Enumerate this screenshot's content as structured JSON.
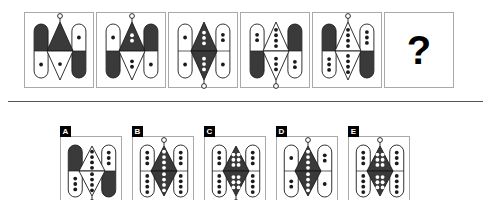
{
  "puzzle": {
    "type": "visual-analogy-matrix",
    "question_mark": "?",
    "divider": true,
    "colors": {
      "ink": "#1a1a1a",
      "dark_fill": "#3a3a3a",
      "light_fill": "#ffffff",
      "stroke": "#1a1a1a",
      "panel_border": "#aaaaaa",
      "letter_badge_bg": "#000000",
      "letter_badge_text": "#ffffff"
    },
    "geometry": {
      "panel_width_seq": 70,
      "panel_height_seq": 76,
      "panel_width_opt": 62,
      "panel_height_opt": 68,
      "capsule_width": 14,
      "capsule_height": 54,
      "diamond_width": 26,
      "diamond_height": 58
    },
    "sequence": [
      {
        "index": 1,
        "name": "sequence-panel-1",
        "left_capsule": {
          "top_fill": "dark",
          "bottom_fill": "light",
          "top_dots": 0,
          "bottom_dots": 1,
          "dot_color": "dark",
          "knob": "none"
        },
        "center_diamond": {
          "top_fill": "dark",
          "bottom_fill": "light",
          "top_dots": 0,
          "bottom_dots": 1,
          "dot_color": "dark",
          "knob": "top"
        },
        "right_capsule": {
          "top_fill": "light",
          "bottom_fill": "dark",
          "top_dots": 1,
          "bottom_dots": 0,
          "dot_color": "dark",
          "knob": "none"
        }
      },
      {
        "index": 2,
        "name": "sequence-panel-2",
        "left_capsule": {
          "top_fill": "light",
          "bottom_fill": "dark",
          "top_dots": 1,
          "bottom_dots": 0,
          "dot_color": "dark",
          "knob": "none"
        },
        "center_diamond": {
          "top_fill": "dark",
          "bottom_fill": "light",
          "top_dots": 2,
          "bottom_dots": 2,
          "dot_color": "mixed",
          "knob": "top"
        },
        "right_capsule": {
          "top_fill": "dark",
          "bottom_fill": "light",
          "top_dots": 0,
          "bottom_dots": 1,
          "dot_color": "dark",
          "knob": "none"
        }
      },
      {
        "index": 3,
        "name": "sequence-panel-3",
        "left_capsule": {
          "top_fill": "light",
          "bottom_fill": "light",
          "top_dots": 1,
          "bottom_dots": 1,
          "dot_color": "dark",
          "knob": "none"
        },
        "center_diamond": {
          "top_fill": "dark",
          "bottom_fill": "dark",
          "top_dots": 3,
          "bottom_dots": 3,
          "dot_color": "light",
          "knob": "bottom"
        },
        "right_capsule": {
          "top_fill": "light",
          "bottom_fill": "light",
          "top_dots": 2,
          "bottom_dots": 1,
          "dot_color": "dark",
          "knob": "none"
        }
      },
      {
        "index": 4,
        "name": "sequence-panel-4",
        "left_capsule": {
          "top_fill": "light",
          "bottom_fill": "dark",
          "top_dots": 2,
          "bottom_dots": 0,
          "dot_color": "dark",
          "knob": "none"
        },
        "center_diamond": {
          "top_fill": "light",
          "bottom_fill": "light",
          "top_dots": 4,
          "bottom_dots": 3,
          "dot_color": "dark",
          "knob": "bottom"
        },
        "right_capsule": {
          "top_fill": "dark",
          "bottom_fill": "light",
          "top_dots": 0,
          "bottom_dots": 2,
          "dot_color": "dark",
          "knob": "none"
        }
      },
      {
        "index": 5,
        "name": "sequence-panel-5",
        "left_capsule": {
          "top_fill": "dark",
          "bottom_fill": "light",
          "top_dots": 0,
          "bottom_dots": 3,
          "dot_color": "dark",
          "knob": "none"
        },
        "center_diamond": {
          "top_fill": "light",
          "bottom_fill": "light",
          "top_dots": 4,
          "bottom_dots": 4,
          "dot_color": "dark",
          "knob": "top"
        },
        "right_capsule": {
          "top_fill": "light",
          "bottom_fill": "dark",
          "top_dots": 3,
          "bottom_dots": 0,
          "dot_color": "dark",
          "knob": "none"
        }
      },
      {
        "index": 6,
        "name": "sequence-panel-question",
        "is_question": true
      }
    ],
    "options": [
      {
        "letter": "A",
        "name": "option-a",
        "left_capsule": {
          "top_fill": "dark",
          "bottom_fill": "light",
          "top_dots": 0,
          "bottom_dots": 3,
          "dot_color": "dark",
          "knob": "none"
        },
        "center_diamond": {
          "top_fill": "light",
          "bottom_fill": "light",
          "top_dots": 4,
          "bottom_dots": 4,
          "dot_color": "dark",
          "knob": "bottom"
        },
        "right_capsule": {
          "top_fill": "light",
          "bottom_fill": "dark",
          "top_dots": 3,
          "bottom_dots": 0,
          "dot_color": "dark",
          "knob": "none"
        }
      },
      {
        "letter": "B",
        "name": "option-b",
        "left_capsule": {
          "top_fill": "light",
          "bottom_fill": "light",
          "top_dots": 3,
          "bottom_dots": 4,
          "dot_color": "dark",
          "knob": "none"
        },
        "center_diamond": {
          "top_fill": "dark",
          "bottom_fill": "dark",
          "top_dots": 4,
          "bottom_dots": 4,
          "dot_color": "light",
          "knob": "top"
        },
        "right_capsule": {
          "top_fill": "light",
          "bottom_fill": "light",
          "top_dots": 3,
          "bottom_dots": 4,
          "dot_color": "dark",
          "knob": "none"
        }
      },
      {
        "letter": "C",
        "name": "option-c",
        "left_capsule": {
          "top_fill": "light",
          "bottom_fill": "light",
          "top_dots": 3,
          "bottom_dots": 4,
          "dot_color": "dark",
          "knob": "none"
        },
        "center_diamond": {
          "top_fill": "dark",
          "bottom_fill": "dark",
          "top_dots": 6,
          "bottom_dots": 6,
          "dot_color": "light",
          "knob": "bottom"
        },
        "right_capsule": {
          "top_fill": "light",
          "bottom_fill": "light",
          "top_dots": 3,
          "bottom_dots": 4,
          "dot_color": "dark",
          "knob": "none"
        }
      },
      {
        "letter": "D",
        "name": "option-d",
        "left_capsule": {
          "top_fill": "light",
          "bottom_fill": "light",
          "top_dots": 1,
          "bottom_dots": 2,
          "dot_color": "dark",
          "knob": "none"
        },
        "center_diamond": {
          "top_fill": "dark",
          "bottom_fill": "dark",
          "top_dots": 4,
          "bottom_dots": 4,
          "dot_color": "light",
          "knob": "top"
        },
        "right_capsule": {
          "top_fill": "light",
          "bottom_fill": "light",
          "top_dots": 2,
          "bottom_dots": 1,
          "dot_color": "dark",
          "knob": "none"
        }
      },
      {
        "letter": "E",
        "name": "option-e",
        "left_capsule": {
          "top_fill": "light",
          "bottom_fill": "light",
          "top_dots": 3,
          "bottom_dots": 4,
          "dot_color": "dark",
          "knob": "none"
        },
        "center_diamond": {
          "top_fill": "dark",
          "bottom_fill": "dark",
          "top_dots": 6,
          "bottom_dots": 6,
          "dot_color": "light",
          "knob": "top"
        },
        "right_capsule": {
          "top_fill": "light",
          "bottom_fill": "light",
          "top_dots": 3,
          "bottom_dots": 4,
          "dot_color": "dark",
          "knob": "none"
        }
      }
    ]
  }
}
